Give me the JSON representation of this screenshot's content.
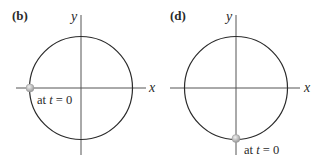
{
  "panels": [
    {
      "label": "(b)",
      "x_axis_label": "x",
      "y_axis_label": "y",
      "point_annotation_prefix": "at ",
      "point_annotation_var": "t",
      "point_annotation_suffix": " = 0",
      "point_position": "left intersection of circle with x-axis"
    },
    {
      "label": "(d)",
      "x_axis_label": "x",
      "y_axis_label": "y",
      "point_annotation_prefix": "at ",
      "point_annotation_var": "t",
      "point_annotation_suffix": " = 0",
      "point_position": "bottom intersection of circle with y-axis"
    }
  ],
  "colors": {
    "line": "#2a2a2a",
    "axis": "#555555",
    "point": "#bdbdbd"
  }
}
